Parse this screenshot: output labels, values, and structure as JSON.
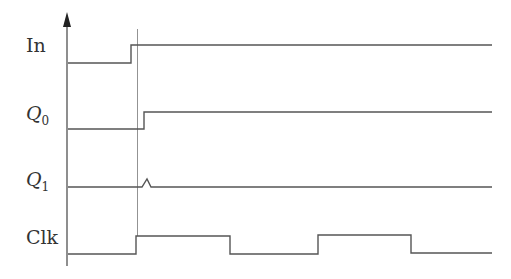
{
  "diagram": {
    "type": "timing-diagram",
    "signals": [
      {
        "id": "in",
        "label": "In",
        "subscript": "",
        "italic": false
      },
      {
        "id": "q0",
        "label": "Q",
        "subscript": "0",
        "italic": true
      },
      {
        "id": "q1",
        "label": "Q",
        "subscript": "1",
        "italic": true
      },
      {
        "id": "clk",
        "label": "Clk",
        "subscript": "",
        "italic": false
      }
    ],
    "events": {
      "in_rise_x": 131,
      "guide_line_x": 137,
      "q0_rise_x": 144,
      "q1_glitch_x": 147,
      "clk_edges_x": [
        136,
        230,
        318,
        411
      ]
    },
    "axis": {
      "has_arrow": true
    }
  }
}
